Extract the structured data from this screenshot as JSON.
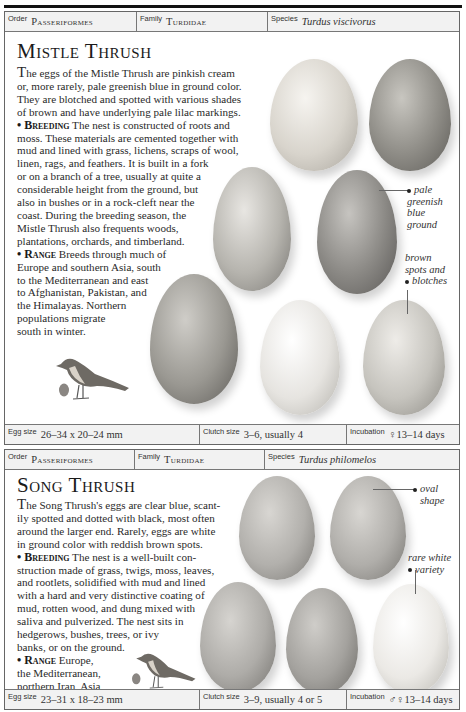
{
  "entries": [
    {
      "header": {
        "order_label": "Order",
        "order": "Passeriformes",
        "family_label": "Family",
        "family": "Turdidae",
        "species_label": "Species",
        "species": "Turdus viscivorus"
      },
      "title": "Mistle Thrush",
      "paragraphs": {
        "intro_lines": [
          "he eggs of the Mistle Thrush are pinkish cream",
          "or, more rarely, pale greenish blue in ground color.",
          "They are blotched and spotted with various shades",
          "of brown and have underlying pale lilac markings."
        ],
        "intro_dropcap": "T",
        "breeding_label": "• Breeding",
        "breeding_lines": [
          " The nest is constructed of roots and",
          "moss. These materials are cemented together with",
          "mud and lined with grass, lichens, scraps of wool,",
          "linen, rags, and feathers. It is built in a fork",
          "or on a branch of a tree, usually at quite a",
          "considerable height from the ground, but",
          "also in bushes or in a rock-cleft near the",
          "coast. During the breeding season, the",
          "Mistle Thrush also frequents woods,",
          "plantations, orchards, and timberland."
        ],
        "range_label": "• Range",
        "range_lines": [
          " Breeds through much of",
          "Europe and southern Asia, south",
          "to the Mediterranean and east",
          "to Afghanistan, Pakistan, and",
          "the Himalayas. Northern",
          "populations migrate",
          "south in winter."
        ]
      },
      "annotations": [
        {
          "text_lines": [
            "pale",
            "greenish",
            "blue",
            "ground"
          ]
        },
        {
          "text_lines": [
            "brown",
            "spots and",
            "blotches"
          ]
        }
      ],
      "footer": {
        "egg_size_label": "Egg size",
        "egg_size": "26–34 x 20–24 mm",
        "clutch_label": "Clutch size",
        "clutch": "3–6, usually 4",
        "incubation_label": "Incubation",
        "incubation": "♀13–14 days"
      }
    },
    {
      "header": {
        "order_label": "Order",
        "order": "Passeriformes",
        "family_label": "Family",
        "family": "Turdidae",
        "species_label": "Species",
        "species": "Turdus philomelos"
      },
      "title": "Song Thrush",
      "paragraphs": {
        "intro_dropcap": "T",
        "intro_lines": [
          "he Song Thrush's eggs are clear blue, scant-",
          "ily spotted and dotted with black, most often",
          "around the larger end. Rarely, eggs are white",
          "in ground color with reddish brown spots."
        ],
        "breeding_label": "• Breeding",
        "breeding_lines": [
          " The nest is a well-built con-",
          "struction made of grass, twigs, moss, leaves,",
          "and rootlets, solidified with mud and lined",
          "with a hard and very distinctive coating of",
          "mud, rotten wood, and dung mixed with",
          "saliva and pulverized. The nest sits in",
          "hedgerows, bushes, trees, or ivy",
          "banks, or on the ground."
        ],
        "range_label": "• Range",
        "range_lines": [
          " Europe,",
          "the Mediterranean,",
          "northern Iran, Asia,",
          "and western China."
        ]
      },
      "annotations": [
        {
          "text_lines": [
            "oval",
            "shape"
          ]
        },
        {
          "text_lines": [
            "rare white",
            "variety"
          ]
        }
      ],
      "footer": {
        "egg_size_label": "Egg size",
        "egg_size": "23–31 x 18–23 mm",
        "clutch_label": "Clutch size",
        "clutch": "3–9, usually 4 or 5",
        "incubation_label": "Incubation",
        "incubation": "♂♀13–14 days"
      }
    }
  ],
  "colors": {
    "border": "#666666",
    "header_bg": "#f2f2f2",
    "text": "#2a2a2a"
  }
}
